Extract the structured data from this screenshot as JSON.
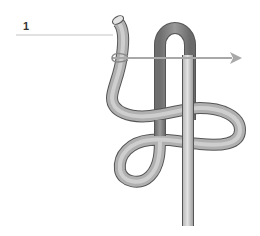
{
  "diagram": {
    "callouts": [
      {
        "id": "1",
        "label": "1",
        "target": "rope-working-end"
      }
    ],
    "arrow": {
      "direction": "right",
      "meaning": "pull direction"
    },
    "colors": {
      "rope_light": "#d4d4d4",
      "rope_mid": "#a9a9a9",
      "rope_dark": "#7a7a7a",
      "rope_outline": "#555555",
      "leader_line": "#bbbbbb",
      "arrow": "#a8a8a8",
      "label": "#333333"
    }
  }
}
